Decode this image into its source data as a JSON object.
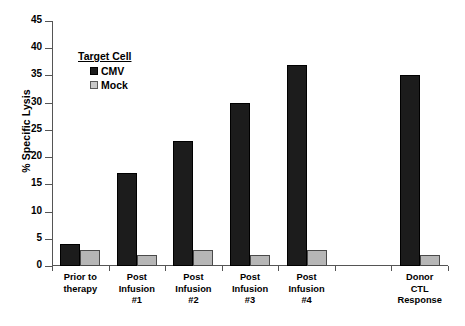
{
  "chart_data": {
    "type": "bar",
    "title": "",
    "xlabel": "",
    "ylabel": "% Specific Lysis",
    "ylim": [
      0,
      45
    ],
    "ytick_step": 5,
    "yticks": [
      45,
      40,
      35,
      30,
      25,
      20,
      15,
      10,
      5,
      0
    ],
    "grid": false,
    "legend_position": "upper-left-inside",
    "legend_title": "Target Cell",
    "categories": [
      "Prior to therapy",
      "Post Infusion #1",
      "Post Infusion #2",
      "Post Infusion #3",
      "Post Infusion #4",
      "",
      "Donor CTL Response"
    ],
    "category_label_lines": [
      [
        "Prior to",
        "therapy"
      ],
      [
        "Post",
        "Infusion",
        "#1"
      ],
      [
        "Post",
        "Infusion",
        "#2"
      ],
      [
        "Post",
        "Infusion",
        "#3"
      ],
      [
        "Post",
        "Infusion",
        "#4"
      ],
      [],
      [
        "Donor",
        "CTL",
        "Response"
      ]
    ],
    "series": [
      {
        "name": "CMV",
        "color": "#1c1c1c",
        "values": [
          4,
          17,
          23,
          30,
          37,
          null,
          35
        ]
      },
      {
        "name": "Mock",
        "color": "#b6b6b6",
        "values": [
          3,
          2,
          3,
          2,
          3,
          null,
          2
        ]
      }
    ]
  },
  "legend": {
    "title": "Target Cell",
    "entries": [
      {
        "label": "CMV",
        "swatch": "cmv-swatch-icon"
      },
      {
        "label": "Mock",
        "swatch": "mock-swatch-icon"
      }
    ]
  },
  "axes": {
    "y_title": "% Specific Lysis",
    "y_labels": [
      "45",
      "40",
      "35",
      "30",
      "25",
      "20",
      "15",
      "10",
      "5",
      "0"
    ]
  }
}
